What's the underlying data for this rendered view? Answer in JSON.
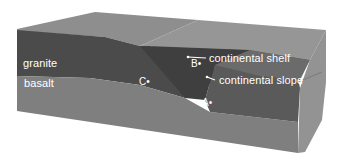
{
  "diagram": {
    "layers": [
      {
        "name": "granite",
        "label": "granite",
        "color": "#4f4f4f"
      },
      {
        "name": "basalt",
        "label": "basalt",
        "color": "#7a7a7a"
      }
    ],
    "features": [
      {
        "name": "continental-shelf",
        "label": "continental shelf"
      },
      {
        "name": "continental-slope",
        "label": "continental slope"
      }
    ],
    "points": [
      {
        "id": "A",
        "label": "A•"
      },
      {
        "id": "B",
        "label": "B•"
      },
      {
        "id": "C",
        "label": "C•"
      }
    ],
    "colors": {
      "top_surface": "#8c8c8c",
      "granite_front": "#4a4a4a",
      "basalt_front": "#7d7d7d",
      "ocean_water": "#6a6a6a",
      "side_face": "#8e8e8e",
      "label_text": "#ffffff"
    }
  }
}
